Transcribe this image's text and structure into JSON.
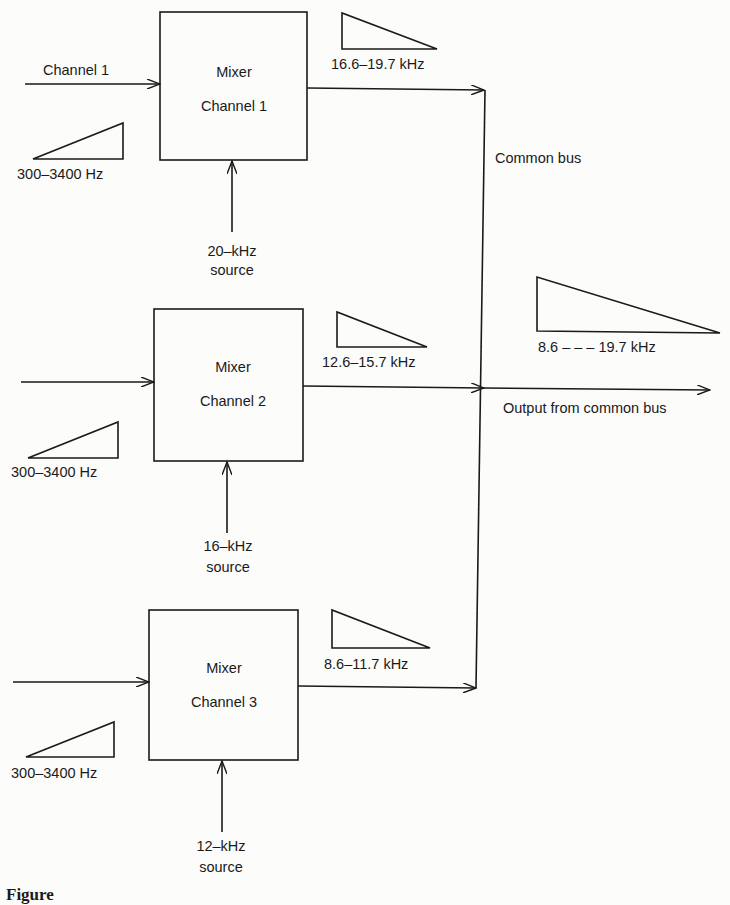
{
  "diagram": {
    "input_label": "Channel 1",
    "common_bus_label": "Common bus",
    "output_label": "Output from common bus",
    "output_spectrum_label": "8.6 – – – 19.7 kHz",
    "caption_fragment": "Figure",
    "channels": [
      {
        "mixer_title": "Mixer",
        "mixer_channel": "Channel 1",
        "input_spectrum": "300–3400 Hz",
        "carrier_line1": "20–kHz",
        "carrier_line2": "source",
        "output_spectrum": "16.6–19.7 kHz"
      },
      {
        "mixer_title": "Mixer",
        "mixer_channel": "Channel 2",
        "input_spectrum": "300–3400 Hz",
        "carrier_line1": "16–kHz",
        "carrier_line2": "source",
        "output_spectrum": "12.6–15.7 kHz"
      },
      {
        "mixer_title": "Mixer",
        "mixer_channel": "Channel 3",
        "input_spectrum": "300–3400 Hz",
        "carrier_line1": "12–kHz",
        "carrier_line2": "source",
        "output_spectrum": "8.6–11.7 kHz"
      }
    ]
  }
}
